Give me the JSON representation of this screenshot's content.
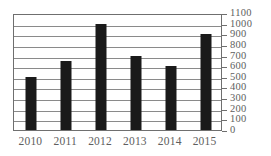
{
  "chart_data": {
    "type": "bar",
    "title": "",
    "subtitle": "",
    "xlabel": "",
    "ylabel": "",
    "categories": [
      "2010",
      "2011",
      "2012",
      "2013",
      "2014",
      "2015"
    ],
    "values": [
      500,
      650,
      1000,
      700,
      600,
      900
    ],
    "ylim": [
      0,
      1100
    ],
    "ytick_labels": [
      "1100",
      "1000",
      "900",
      "800",
      "700",
      "600",
      "500",
      "400",
      "300",
      "200",
      "100",
      "0"
    ],
    "ytick_values": [
      1100,
      1000,
      900,
      800,
      700,
      600,
      500,
      400,
      300,
      200,
      100,
      0
    ],
    "ytick_step": 100,
    "grid": true,
    "grid_axis": "y",
    "legend": false,
    "legend_position": "none",
    "y_axis_position": "right",
    "colors": {
      "bar": "#1a1a1a",
      "gridline": "#8a8a8a",
      "frame": "#6f6f6f",
      "tick_label": "#5e5e5e",
      "background": "#ffffff"
    }
  }
}
